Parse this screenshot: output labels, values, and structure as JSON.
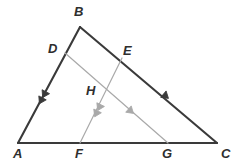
{
  "figure": {
    "kind": "geometry-diagram",
    "width": 238,
    "height": 167,
    "background_color": "#ffffff"
  },
  "colors": {
    "triangle_stroke": "#3a3a3a",
    "cevian_stroke": "#a9a9a9",
    "label_color": "#2e2e2e"
  },
  "strokes": {
    "triangle_width": 2.1,
    "cevian_width": 1.2
  },
  "points": [
    {
      "id": "A",
      "label": "A",
      "x": 18,
      "y": 143,
      "label_x": 13,
      "label_y": 147
    },
    {
      "id": "B",
      "label": "B",
      "x": 80,
      "y": 27,
      "label_x": 74,
      "label_y": 5
    },
    {
      "id": "C",
      "label": "C",
      "x": 217,
      "y": 143,
      "label_x": 221,
      "label_y": 147
    },
    {
      "id": "D",
      "label": "D",
      "x": 65,
      "y": 53,
      "label_x": 48,
      "label_y": 42
    },
    {
      "id": "E",
      "label": "E",
      "x": 122,
      "y": 58,
      "label_x": 123,
      "label_y": 44
    },
    {
      "id": "F",
      "label": "F",
      "x": 80,
      "y": 143,
      "label_x": 75,
      "label_y": 147
    },
    {
      "id": "G",
      "label": "G",
      "x": 168,
      "y": 143,
      "label_x": 162,
      "label_y": 147
    },
    {
      "id": "H",
      "label": "H",
      "x": 105,
      "y": 95,
      "label_x": 86,
      "label_y": 84
    }
  ],
  "segments": [
    {
      "id": "AB",
      "from": "A",
      "to": "B",
      "style": "triangle",
      "x1": 18,
      "y1": 143,
      "x2": 80,
      "y2": 27
    },
    {
      "id": "BC",
      "from": "B",
      "to": "C",
      "style": "triangle",
      "x1": 80,
      "y1": 27,
      "x2": 217,
      "y2": 143
    },
    {
      "id": "AC",
      "from": "A",
      "to": "C",
      "style": "triangle",
      "x1": 18,
      "y1": 143,
      "x2": 217,
      "y2": 143
    },
    {
      "id": "DG",
      "from": "D",
      "to": "G",
      "style": "cevian",
      "x1": 65,
      "y1": 53,
      "x2": 168,
      "y2": 143
    },
    {
      "id": "EF",
      "from": "E",
      "to": "F",
      "style": "cevian",
      "x1": 122,
      "y1": 58,
      "x2": 80,
      "y2": 143
    }
  ],
  "direction_marks": [
    {
      "id": "mark-AB",
      "on_segment": "AB",
      "count": 2,
      "x": 43,
      "y": 97,
      "angle": 118,
      "color": "#3a3a3a"
    },
    {
      "id": "mark-EF",
      "on_segment": "EF",
      "count": 2,
      "x": 98,
      "y": 110,
      "angle": 116,
      "color": "#a9a9a9"
    },
    {
      "id": "mark-BC",
      "on_segment": "BC",
      "count": 1,
      "x": 168,
      "y": 98,
      "angle": 40,
      "color": "#3a3a3a"
    },
    {
      "id": "mark-DG",
      "on_segment": "DG",
      "count": 1,
      "x": 133,
      "y": 113,
      "angle": 41,
      "color": "#a9a9a9"
    }
  ]
}
